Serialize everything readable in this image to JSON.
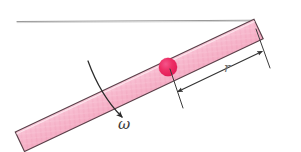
{
  "figure": {
    "background_color": "#ffffff",
    "width": 301,
    "height": 152
  },
  "rod": {
    "name": "rotating-rod",
    "fill_color": "#f6b2c8",
    "fill_color_light": "#fbd3e0",
    "outline_color": "#5a4049",
    "hatch_color": "#f0a0ba",
    "angle_degrees": -25,
    "length_px": 262,
    "thickness_px": 21,
    "start_point": [
      20,
      142
    ],
    "end_point": [
      270,
      24
    ]
  },
  "bead": {
    "name": "bead-mass",
    "label": "",
    "color": "#ec2b62",
    "highlight_color": "#f4548a",
    "center": [
      168,
      67
    ],
    "radius_px": 9
  },
  "horizontal_line": {
    "name": "horizontal-reference-line",
    "color": "#8d8d8d",
    "from": [
      17,
      21
    ],
    "to": [
      252,
      20
    ],
    "stroke_width": 1.1
  },
  "omega_annotation": {
    "label": "ω",
    "label_position": [
      118,
      128
    ],
    "arrow_color": "#2b2b2b",
    "arrow_from": [
      88,
      62
    ],
    "arrow_to": [
      127,
      122
    ],
    "description": "angular velocity curved arrow crossing the rod"
  },
  "radius_dimension": {
    "label": "r",
    "label_position": [
      228,
      69
    ],
    "line_color": "#3a3a3a",
    "arrow_from": [
      177,
      91
    ],
    "arrow_to": [
      262,
      51
    ],
    "extension_left_from": [
      170,
      70
    ],
    "extension_left_to": [
      183,
      107
    ],
    "extension_right_from": [
      256,
      30
    ],
    "extension_right_to": [
      270,
      67
    ],
    "description": "double headed dimension arrow measuring distance r"
  },
  "colors": {
    "rod_pink": "#f6b2c8",
    "bead_red": "#ec2b62",
    "outline_dark": "#5a4049",
    "line_gray": "#8d8d8d",
    "text_dark": "#2b2b2b"
  }
}
